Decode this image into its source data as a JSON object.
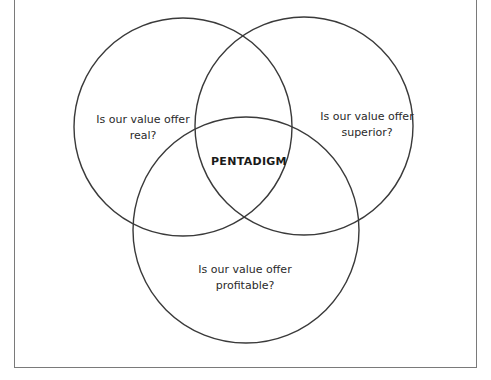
{
  "diagram": {
    "type": "venn",
    "sets": [
      {
        "id": "real",
        "line1": "Is our value offer",
        "line2": "real?"
      },
      {
        "id": "superior",
        "line1": "Is our value offer",
        "line2": "superior?"
      },
      {
        "id": "profitable",
        "line1": "Is our value offer",
        "line2": "profitable?"
      }
    ],
    "intersection_label": "PENTADIGM",
    "colors": {
      "stroke": "#3a3a3a",
      "frame": "#7a7a7a",
      "text": "#2a2a2a"
    }
  }
}
